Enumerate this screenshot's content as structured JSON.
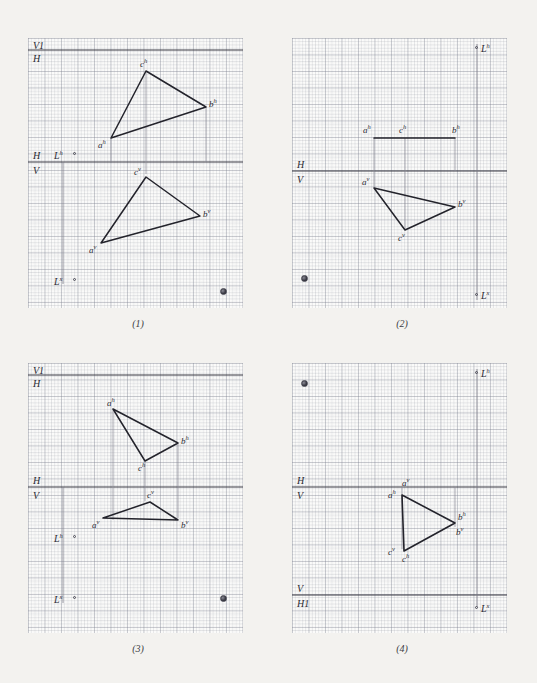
{
  "sheet": {
    "title": "Descriptive geometry worksheet - Monge projections of triangle abc",
    "background_color": "#f3f2ef",
    "grid_color": "#787d8c",
    "ink_color": "#2b2b33"
  },
  "panels": [
    {
      "caption": "(1)",
      "edge_labels": [
        {
          "name": "v1-label",
          "text": "V1"
        },
        {
          "name": "h-label-top",
          "text": "H"
        },
        {
          "name": "h-label-mid",
          "text": "H"
        },
        {
          "name": "v-label-mid",
          "text": "V"
        },
        {
          "name": "lh-label",
          "text": "L",
          "sup": "h"
        },
        {
          "name": "lx-label",
          "text": "L",
          "sup": "x"
        }
      ],
      "top_view": {
        "name": "horizontal-projection-triangle",
        "vertices": [
          {
            "label": "a",
            "sup": "h"
          },
          {
            "label": "b",
            "sup": "h"
          },
          {
            "label": "c",
            "sup": "h"
          }
        ]
      },
      "front_view": {
        "name": "vertical-projection-triangle",
        "vertices": [
          {
            "label": "a",
            "sup": "v"
          },
          {
            "label": "b",
            "sup": "v"
          },
          {
            "label": "c",
            "sup": "v"
          }
        ]
      }
    },
    {
      "caption": "(2)",
      "edge_labels": [
        {
          "name": "h-label-mid",
          "text": "H"
        },
        {
          "name": "v-label-mid",
          "text": "V"
        },
        {
          "name": "lh-label",
          "text": "L",
          "sup": "h"
        },
        {
          "name": "lx-label",
          "text": "L",
          "sup": "x"
        }
      ],
      "top_view": {
        "name": "horizontal-projection-segment",
        "vertices": [
          {
            "label": "a",
            "sup": "h"
          },
          {
            "label": "c",
            "sup": "h"
          },
          {
            "label": "b",
            "sup": "h"
          }
        ]
      },
      "front_view": {
        "name": "vertical-projection-triangle",
        "vertices": [
          {
            "label": "a",
            "sup": "v"
          },
          {
            "label": "b",
            "sup": "v"
          },
          {
            "label": "c",
            "sup": "v"
          }
        ]
      }
    },
    {
      "caption": "(3)",
      "edge_labels": [
        {
          "name": "v1-label",
          "text": "V1"
        },
        {
          "name": "h-label-top",
          "text": "H"
        },
        {
          "name": "h-label-mid",
          "text": "H"
        },
        {
          "name": "v-label-mid",
          "text": "V"
        },
        {
          "name": "lh-label",
          "text": "L",
          "sup": "h"
        },
        {
          "name": "lx-label",
          "text": "L",
          "sup": "x"
        }
      ],
      "top_view": {
        "name": "horizontal-projection-triangle",
        "vertices": [
          {
            "label": "a",
            "sup": "h"
          },
          {
            "label": "b",
            "sup": "h"
          },
          {
            "label": "c",
            "sup": "h"
          }
        ]
      },
      "front_view": {
        "name": "vertical-projection-triangle",
        "vertices": [
          {
            "label": "a",
            "sup": "v"
          },
          {
            "label": "c",
            "sup": "v"
          },
          {
            "label": "b",
            "sup": "v"
          }
        ]
      }
    },
    {
      "caption": "(4)",
      "edge_labels": [
        {
          "name": "h-label-mid",
          "text": "H"
        },
        {
          "name": "v-label-mid",
          "text": "V"
        },
        {
          "name": "v-label-bottom",
          "text": "V"
        },
        {
          "name": "h1-label",
          "text": "H1"
        },
        {
          "name": "lh-label",
          "text": "L",
          "sup": "h"
        },
        {
          "name": "lx-label",
          "text": "L",
          "sup": "x"
        }
      ],
      "combined_view": {
        "name": "coincident-projections-triangle",
        "vertices": [
          {
            "label": "a",
            "sup": "h"
          },
          {
            "label": "a",
            "sup": "v"
          },
          {
            "label": "b",
            "sup": "h"
          },
          {
            "label": "b",
            "sup": "v"
          },
          {
            "label": "c",
            "sup": "v"
          },
          {
            "label": "c",
            "sup": "h"
          }
        ]
      }
    }
  ]
}
